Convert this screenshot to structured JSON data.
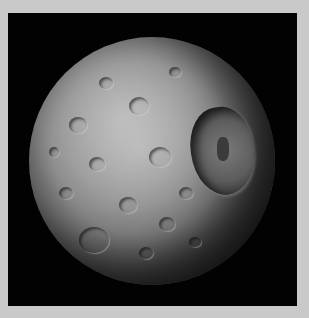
{
  "image": {
    "subject": "Cratered moon (Mimas) against black space",
    "alt": "Grayscale image of a heavily cratered moon with a large crater on the right side",
    "colors": {
      "border": "#c9c9c9",
      "space": "#020202",
      "surface_light": "#a9a9a9",
      "surface_dark": "#1e1e1e"
    }
  }
}
